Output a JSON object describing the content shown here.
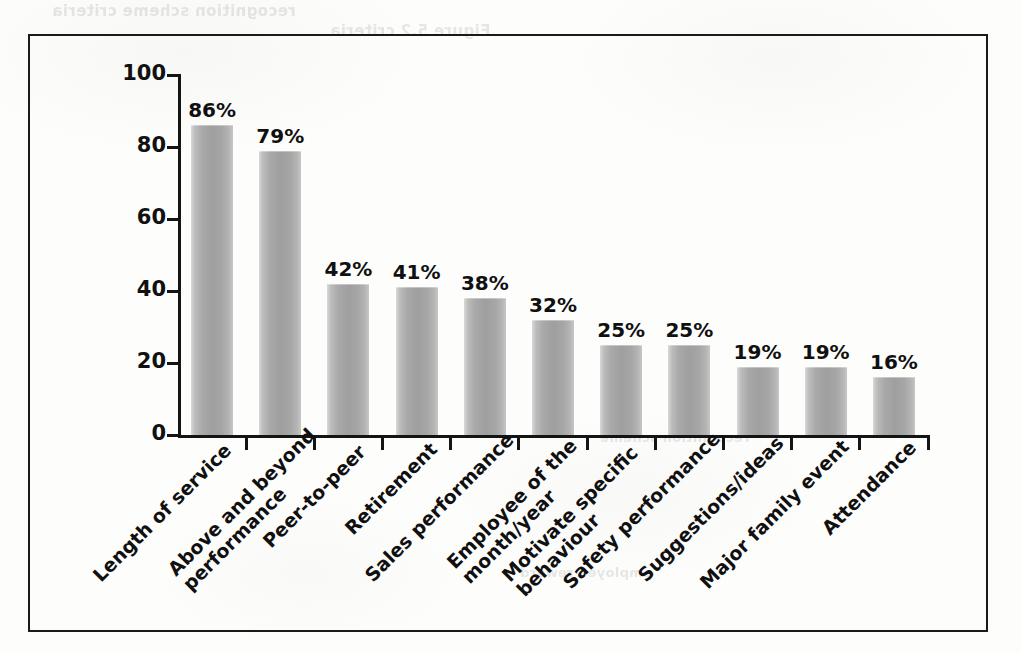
{
  "page": {
    "background_color": "#fdfdfc",
    "frame_color": "#1a1a1a",
    "bleed_through_text": {
      "top_line_1": "recognition scheme criteria",
      "top_line_2": "Figure 5.2 criteria",
      "mid_line_1": "recognition scheme",
      "mid_line_2": "employee reward"
    }
  },
  "chart_data": {
    "type": "bar",
    "title": "",
    "subtitle": "",
    "xlabel": "",
    "ylabel": "",
    "ylim": [
      0,
      100
    ],
    "yticks": [
      "0",
      "20",
      "40",
      "60",
      "80",
      "100"
    ],
    "ytick_values": [
      0,
      20,
      40,
      60,
      80,
      100
    ],
    "grid": false,
    "legend": false,
    "legend_position": "none",
    "value_suffix": "%",
    "bar_color": "#a9a9a9",
    "bar_edge_color": "#9f9f9f",
    "categories": [
      "Length of service",
      "Above and beyond performance",
      "Peer-to-peer",
      "Retirement",
      "Sales performance",
      "Employee of the month/year",
      "Motivate specific behaviour",
      "Safety performance",
      "Suggestions/ideas",
      "Major family event",
      "Attendance"
    ],
    "category_lines": [
      [
        "Length of service"
      ],
      [
        "Above and beyond",
        "performance"
      ],
      [
        "Peer-to-peer"
      ],
      [
        "Retirement"
      ],
      [
        "Sales performance"
      ],
      [
        "Employee of the",
        "month/year"
      ],
      [
        "Motivate specific",
        "behaviour"
      ],
      [
        "Safety performance"
      ],
      [
        "Suggestions/ideas"
      ],
      [
        "Major family event"
      ],
      [
        "Attendance"
      ]
    ],
    "values": [
      86,
      79,
      42,
      41,
      38,
      32,
      25,
      25,
      19,
      19,
      16
    ],
    "value_labels": [
      "86%",
      "79%",
      "42%",
      "41%",
      "38%",
      "32%",
      "25%",
      "25%",
      "19%",
      "19%",
      "16%"
    ]
  }
}
